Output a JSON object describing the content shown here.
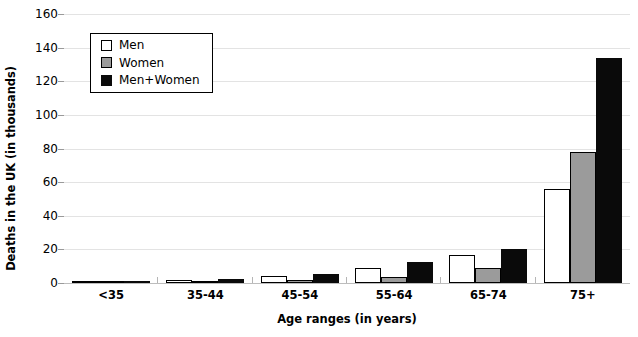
{
  "chart_data": {
    "type": "bar",
    "title": "",
    "xlabel": "Age ranges (in years)",
    "ylabel": "Deaths in the UK (in thousands)",
    "categories": [
      "<35",
      "35-44",
      "45-54",
      "55-64",
      "65-74",
      "75+"
    ],
    "series": [
      {
        "name": "Men",
        "color": "#ffffff",
        "values": [
          0.6,
          1.5,
          4.0,
          9.0,
          16.5,
          56.0
        ]
      },
      {
        "name": "Women",
        "color": "#9b9b9b",
        "values": [
          0.4,
          0.8,
          1.5,
          3.5,
          9.0,
          78.0
        ]
      },
      {
        "name": "Men+Women",
        "color": "#0a0a0a",
        "values": [
          1.0,
          2.5,
          5.5,
          12.5,
          20.0,
          134.0
        ]
      }
    ],
    "ylim": [
      0,
      160
    ],
    "yticks": [
      0,
      20,
      40,
      60,
      80,
      100,
      120,
      140,
      160
    ],
    "ytick_labels": [
      "0",
      "20",
      "40",
      "60",
      "80",
      "100",
      "120",
      "140",
      "160"
    ],
    "grid": true,
    "legend_position": "top-left"
  },
  "legend": {
    "items": [
      {
        "label": "Men",
        "swatch": "white-square-icon"
      },
      {
        "label": "Women",
        "swatch": "gray-square-icon"
      },
      {
        "label": "Men+Women",
        "swatch": "black-square-icon"
      }
    ]
  }
}
